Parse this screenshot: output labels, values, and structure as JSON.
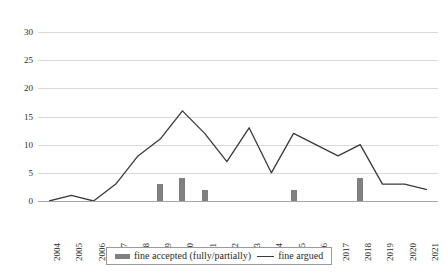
{
  "chart_data": {
    "type": "bar",
    "title": "",
    "subtitle": "",
    "xlabel": "",
    "ylabel": "",
    "categories": [
      "2004",
      "2005",
      "2006",
      "2007",
      "2008",
      "2009",
      "2010",
      "2011",
      "2012",
      "2013",
      "2014",
      "2015",
      "2016",
      "2017",
      "2018",
      "2019",
      "2020",
      "2021"
    ],
    "series": [
      {
        "name": "fine accepted (fully/partially)",
        "type": "bar",
        "color": "#808080",
        "values": [
          0,
          0,
          0,
          0,
          0,
          3,
          4,
          2,
          0,
          0,
          0,
          2,
          0,
          0,
          4,
          0,
          0,
          0
        ]
      },
      {
        "name": "fine argued",
        "type": "line",
        "color": "#3a3a3a",
        "values": [
          0,
          1,
          0,
          3,
          8,
          11,
          16,
          12,
          7,
          13,
          5,
          12,
          10,
          8,
          10,
          3,
          3,
          2
        ]
      }
    ],
    "ylim": [
      0,
      30
    ],
    "yticks": [
      0,
      5,
      10,
      15,
      20,
      25,
      30
    ],
    "ytick_labels": [
      "0",
      "5",
      "10",
      "15",
      "20",
      "25",
      "30"
    ],
    "grid": true,
    "legend_position": "bottom"
  },
  "legend": {
    "entries": [
      {
        "label": "fine accepted (fully/partially)",
        "marker": "bar-swatch"
      },
      {
        "label": "fine argued",
        "marker": "line-swatch"
      }
    ]
  },
  "colors": {
    "bar": "#808080",
    "line": "#3a3a3a",
    "gridline": "#d9d9d9",
    "axis": "#a6a6a6",
    "background": "#ffffff",
    "text": "#2b2b2b"
  }
}
